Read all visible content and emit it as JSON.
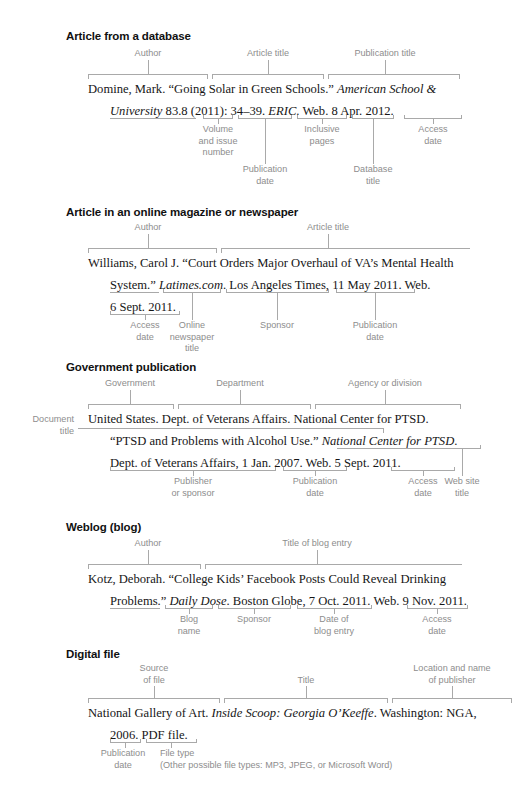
{
  "document": {
    "title": "MLA works-cited entry diagrams — electronic sources"
  },
  "sections": [
    {
      "id": "article-from-a-database",
      "heading": "Article from a database",
      "citation_lines": [
        "Domine, Mark. “Going Solar in Green Schools.” American School &",
        "University 83.8 (2011): 34–39. ERIC. Web. 8 Apr. 2012."
      ],
      "top_labels": [
        "Author",
        "Article title",
        "Publication title"
      ],
      "bottom_labels": [
        "Volume\nand issue\nnumber",
        "Inclusive\npages",
        "Access\ndate",
        "Publication\ndate",
        "Database\ntitle"
      ]
    },
    {
      "id": "article-in-an-online-magazine-or-newspaper",
      "heading": "Article in an online magazine or newspaper",
      "citation_lines": [
        "Williams, Carol J. “Court Orders Major Overhaul of VA’s Mental Health",
        "System.” Latimes.com. Los Angeles Times, 11 May 2011. Web.",
        "6 Sept. 2011."
      ],
      "top_labels": [
        "Author",
        "Article title"
      ],
      "bottom_labels": [
        "Access\ndate",
        "Online\nnewspaper\ntitle",
        "Sponsor",
        "Publication\ndate"
      ]
    },
    {
      "id": "government-publication",
      "heading": "Government publication",
      "citation_lines": [
        "United States. Dept. of Veterans Affairs. National Center for PTSD.",
        "“PTSD and Problems with Alcohol Use.” National Center for PTSD.",
        "Dept. of Veterans Affairs, 1 Jan. 2007. Web. 5 Sept. 2011."
      ],
      "top_labels": [
        "Government",
        "Department",
        "Agency or division"
      ],
      "side_label": "Document\ntitle",
      "bottom_labels": [
        "Publisher\nor sponsor",
        "Publication\ndate",
        "Access\ndate",
        "Web site\ntitle"
      ]
    },
    {
      "id": "weblog-blog",
      "heading": "Weblog (blog)",
      "citation_lines": [
        "Kotz, Deborah. “College Kids’ Facebook Posts Could Reveal Drinking",
        "Problems.” Daily Dose. Boston Globe, 7 Oct. 2011. Web. 9 Nov. 2011."
      ],
      "top_labels": [
        "Author",
        "Title of blog entry"
      ],
      "bottom_labels": [
        "Blog\nname",
        "Sponsor",
        "Date of\nblog entry",
        "Access\ndate"
      ]
    },
    {
      "id": "digital-file",
      "heading": "Digital file",
      "citation_lines": [
        "National Gallery of Art. Inside Scoop: Georgia O’Keeffe. Washington: NGA,",
        "2006. PDF file."
      ],
      "top_labels": [
        "Source\nof file",
        "Title",
        "Location and name\nof publisher"
      ],
      "bottom_labels": [
        "Publication\ndate",
        "File type"
      ],
      "note": "(Other possible file types: MP3, JPEG, or Microsoft Word)"
    }
  ],
  "colors": {
    "text": "#161616",
    "label": "#8d8d8d",
    "rule": "#a9a9a9",
    "background": "#ffffff"
  }
}
